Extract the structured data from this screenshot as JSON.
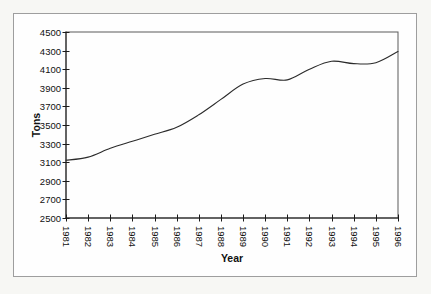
{
  "figure": {
    "page_background": "#f7f7f4",
    "frame_border_color": "#9e9e9e",
    "plot_background": "#fefefe",
    "axis_color": "#1a1a1a",
    "box_color": "#5a5a5a",
    "line_color": "#2b2b2b",
    "text_color": "#101010"
  },
  "chart_data": {
    "type": "line",
    "title": "",
    "xlabel": "Year",
    "ylabel": "Tons",
    "categories": [
      "1981",
      "1982",
      "1983",
      "1984",
      "1985",
      "1986",
      "1987",
      "1988",
      "1989",
      "1990",
      "1991",
      "1992",
      "1993",
      "1994",
      "1995",
      "1996"
    ],
    "series": [
      {
        "name": "Tons",
        "values": [
          3120,
          3155,
          3250,
          3325,
          3400,
          3475,
          3610,
          3775,
          3940,
          4000,
          3985,
          4100,
          4185,
          4160,
          4170,
          4290
        ]
      }
    ],
    "ylim": [
      2500,
      4500
    ],
    "y_tick_step": 200,
    "y_tick_labels": [
      "4500",
      "4300",
      "4100",
      "3900",
      "3700",
      "3500",
      "3300",
      "3100",
      "2900",
      "2700",
      "2500"
    ],
    "grid": false,
    "legend_position": "none"
  }
}
